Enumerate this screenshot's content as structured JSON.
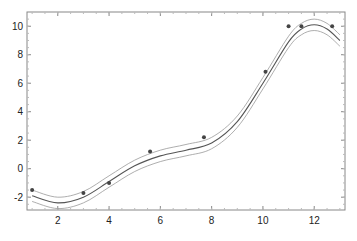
{
  "chart_data": {
    "type": "scatter",
    "title": "",
    "xlabel": "",
    "ylabel": "",
    "xlim": [
      0.8,
      13.2
    ],
    "ylim": [
      -2.9,
      11.0
    ],
    "x_ticks": [
      2,
      4,
      6,
      8,
      10,
      12
    ],
    "y_ticks": [
      -2,
      0,
      2,
      4,
      6,
      8,
      10
    ],
    "grid": false,
    "legend": null,
    "series": [
      {
        "name": "data",
        "kind": "scatter",
        "x": [
          1.0,
          3.0,
          4.0,
          5.6,
          7.7,
          10.1,
          11.0,
          11.5,
          12.7
        ],
        "y": [
          -1.5,
          -1.7,
          -1.0,
          1.2,
          2.2,
          6.8,
          10.0,
          10.0,
          10.0
        ]
      },
      {
        "name": "fit",
        "kind": "line",
        "x": [
          1,
          2,
          3,
          4,
          5,
          6,
          7,
          8,
          9,
          10,
          11,
          11.5,
          12,
          12.5,
          13
        ],
        "y": [
          -1.9,
          -2.4,
          -2.0,
          -0.9,
          0.2,
          0.9,
          1.3,
          1.8,
          3.3,
          6.0,
          8.9,
          9.8,
          10.1,
          9.8,
          9.0
        ]
      },
      {
        "name": "upper band",
        "kind": "line",
        "x": [
          1,
          2,
          3,
          4,
          5,
          6,
          7,
          8,
          9,
          10,
          11,
          11.5,
          12,
          12.5,
          13
        ],
        "y": [
          -1.5,
          -2.0,
          -1.6,
          -0.5,
          0.6,
          1.3,
          1.7,
          2.2,
          3.7,
          6.4,
          9.3,
          10.2,
          10.5,
          10.2,
          9.4
        ]
      },
      {
        "name": "lower band",
        "kind": "line",
        "x": [
          1,
          2,
          3,
          4,
          5,
          6,
          7,
          8,
          9,
          10,
          11,
          11.5,
          12,
          12.5,
          13
        ],
        "y": [
          -2.3,
          -2.8,
          -2.4,
          -1.3,
          -0.2,
          0.5,
          0.9,
          1.4,
          2.9,
          5.6,
          8.5,
          9.4,
          9.7,
          9.4,
          8.6
        ]
      }
    ]
  },
  "colors": {
    "frame": "#888888",
    "line": "#555555",
    "band": "#999999",
    "point": "#444444"
  }
}
